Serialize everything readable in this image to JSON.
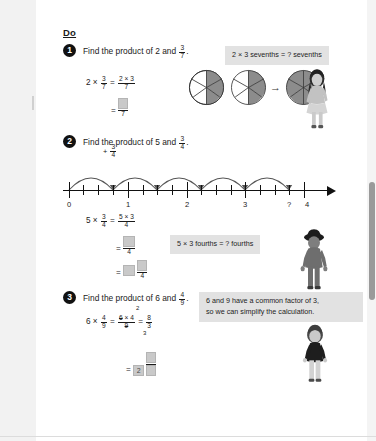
{
  "page": {
    "section_heading": "Do"
  },
  "questions": [
    {
      "number": "1",
      "prompt_before": "Find the product of 2 and",
      "prompt_fraction": {
        "num": "3",
        "den": "7"
      },
      "prompt_after": ".",
      "working": [
        {
          "line": "2 × 3/7 = (2 × 3)/7"
        },
        {
          "line": "= ?/7"
        }
      ],
      "callout": "2 × 3 sevenths = ? sevenths",
      "diagram": {
        "type": "pie-sevenths",
        "segments": 7,
        "shaded": [
          3,
          3,
          6
        ],
        "operator": "→"
      }
    },
    {
      "number": "2",
      "prompt_before": "Find the product of 5 and",
      "prompt_fraction": {
        "num": "3",
        "den": "4"
      },
      "prompt_after": ".",
      "jump_label": {
        "sign": "+",
        "num": "3",
        "den": "4"
      },
      "working": [
        {
          "line": "5 × 3/4 = (5 × 3)/4"
        },
        {
          "line": "= ?/4"
        },
        {
          "line": "= ? ?/4"
        }
      ],
      "callout": "5 × 3 fourths = ? fourths",
      "numberline": {
        "labels": [
          "0",
          "1",
          "2",
          "3",
          "?",
          "4"
        ],
        "jumps": 5,
        "minor_ticks_per_unit": 4
      }
    },
    {
      "number": "3",
      "prompt_before": "Find the product of 6 and",
      "prompt_fraction": {
        "num": "4",
        "den": "9"
      },
      "prompt_after": ".",
      "working": [
        {
          "cancel_top": "2",
          "cancel_bottom": "3",
          "result_num": "8",
          "result_den": "3"
        },
        {
          "line": "= 2 ?/?"
        }
      ],
      "callout_line1": "6 and 9 have a common factor of 3,",
      "callout_line2": "so we can simplify the calculation."
    }
  ],
  "symbols": {
    "times": "×",
    "equals": "=",
    "plus": "+",
    "question": "?",
    "arrow": "→"
  },
  "numbers": {
    "two": "2",
    "three": "3",
    "four": "4",
    "five": "5",
    "six": "6",
    "seven": "7",
    "eight": "8",
    "nine": "9"
  },
  "colors": {
    "page_bg": "#ffffff",
    "surround_bg": "#efefef",
    "callout_bg": "#e2e2e2",
    "blank_box": "#c9c9c9",
    "ink": "#1a1a1a",
    "pie_shade": "#8c8c8c",
    "bullet_bg": "#111111"
  },
  "characters": [
    {
      "name": "girl-standing",
      "position": "right of question 1"
    },
    {
      "name": "boy-with-hat",
      "position": "right of question 2"
    },
    {
      "name": "child-dark-top",
      "position": "right of question 3"
    }
  ]
}
